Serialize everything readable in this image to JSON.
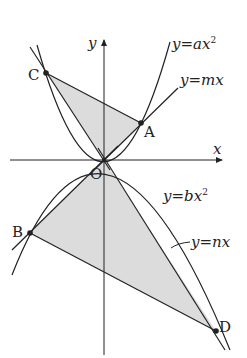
{
  "axes": {
    "x_label": "x",
    "y_label": "y",
    "origin_label": "O"
  },
  "points": {
    "A": "A",
    "B": "B",
    "C": "C",
    "D": "D"
  },
  "curves": {
    "parabola_a": {
      "lhs": "y",
      "eq": "=",
      "rhs": "ax",
      "exp": "2"
    },
    "line_m": {
      "lhs": "y",
      "eq": "=",
      "rhs": "mx"
    },
    "parabola_b": {
      "lhs": "y",
      "eq": "=",
      "rhs": "bx",
      "exp": "2"
    },
    "line_n": {
      "lhs": "y",
      "eq": "=",
      "rhs": "nx"
    }
  },
  "colors": {
    "stroke": "#222222",
    "shade": "#dcdcdc"
  }
}
